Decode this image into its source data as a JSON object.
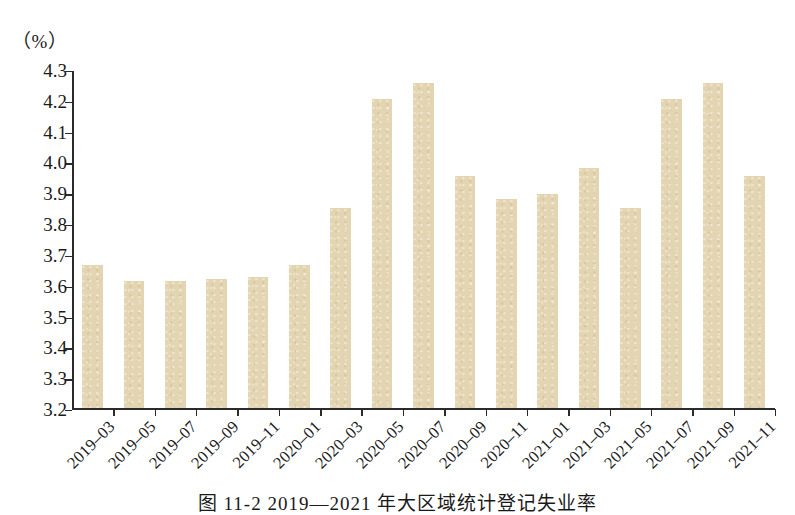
{
  "figure": {
    "unit_label": "（%）",
    "caption": "图 11-2  2019—2021 年大区域统计登记失业率"
  },
  "chart_data": {
    "type": "bar",
    "title": "",
    "subtitle": "",
    "xlabel": "",
    "ylabel": "",
    "unit": "%",
    "ylim": [
      3.2,
      4.3
    ],
    "ytick_step": 0.1,
    "yticks": [
      "4.3",
      "4.2",
      "4.1",
      "4.0",
      "3.9",
      "3.8",
      "3.7",
      "3.6",
      "3.5",
      "3.4",
      "3.3",
      "3.2"
    ],
    "ytick_values": [
      4.3,
      4.2,
      4.1,
      4.0,
      3.9,
      3.8,
      3.7,
      3.6,
      3.5,
      3.4,
      3.3,
      3.2
    ],
    "grid": false,
    "legend": null,
    "bar_color": "#e4d5b2",
    "axis_color": "#2b2b2b",
    "categories": [
      "2019-03",
      "2019-05",
      "2019-07",
      "2019-09",
      "2019-11",
      "2020-01",
      "2020-03",
      "2020-05",
      "2020-07",
      "2020-09",
      "2020-11",
      "2021-01",
      "2021-03",
      "2021-05",
      "2021-07",
      "2021-09",
      "2021-11"
    ],
    "values": [
      3.665,
      3.612,
      3.612,
      3.62,
      3.625,
      3.665,
      3.85,
      4.205,
      4.255,
      3.955,
      3.88,
      3.895,
      3.98,
      3.85,
      4.205,
      4.255,
      3.955
    ]
  }
}
